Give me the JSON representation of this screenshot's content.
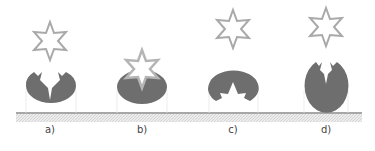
{
  "figure": {
    "colors": {
      "blob": "#6e6e6e",
      "star_stroke": "#a9a9a9",
      "ground_line": "#8a8a8a",
      "ground_hatch": "#d8d8d8",
      "guide": "#e2e2e2"
    },
    "panels": [
      {
        "label": "a)",
        "cx": 50
      },
      {
        "label": "b)",
        "cx": 142
      },
      {
        "label": "c)",
        "cx": 233
      },
      {
        "label": "d)",
        "cx": 326
      }
    ]
  }
}
